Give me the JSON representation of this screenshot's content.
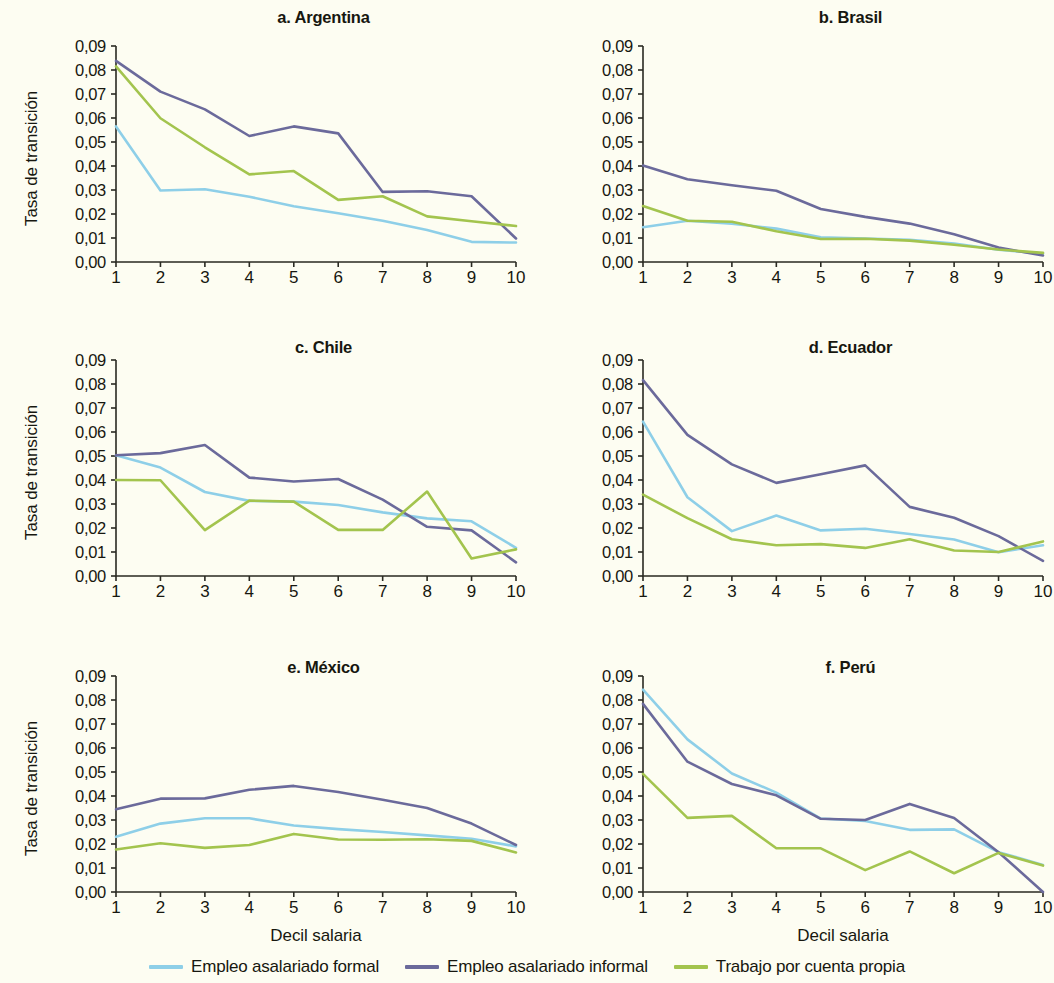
{
  "figure": {
    "background_color": "#fdfdf2",
    "axis_label_y": "Tasa de transición",
    "axis_label_x": "Decil salaria"
  },
  "legend": {
    "position": "bottom-center",
    "items": [
      {
        "label": "Empleo asalariado formal",
        "color": "#8ecfe8"
      },
      {
        "label": "Empleo asalariado informal",
        "color": "#6b6a9b"
      },
      {
        "label": "Trabajo por cuenta propia",
        "color": "#a3c44e"
      }
    ]
  },
  "axes": {
    "y_ticks": [
      "0,00",
      "0,01",
      "0,02",
      "0,03",
      "0,04",
      "0,05",
      "0,06",
      "0,07",
      "0,08",
      "0,09"
    ],
    "y_tick_values": [
      0,
      0.01,
      0.02,
      0.03,
      0.04,
      0.05,
      0.06,
      0.07,
      0.08,
      0.09
    ],
    "x_ticks": [
      "1",
      "2",
      "3",
      "4",
      "5",
      "6",
      "7",
      "8",
      "9",
      "10"
    ],
    "ylim": [
      0,
      0.09
    ],
    "xlim": [
      1,
      10
    ]
  },
  "chart_data": [
    {
      "type": "line",
      "title": "a. Argentina",
      "panel_id": "a",
      "xlabel": "Decil salaria",
      "ylabel": "Tasa de transición",
      "x": [
        1,
        2,
        3,
        4,
        5,
        6,
        7,
        8,
        9,
        10
      ],
      "categories": [
        "1",
        "2",
        "3",
        "4",
        "5",
        "6",
        "7",
        "8",
        "9",
        "10"
      ],
      "ylim": [
        0,
        0.09
      ],
      "grid": false,
      "legend_position": "figure-bottom",
      "series": [
        {
          "name": "Empleo asalariado formal",
          "color": "#8ecfe8",
          "values": [
            0.0565,
            0.0298,
            0.0303,
            0.0272,
            0.0232,
            0.0203,
            0.0172,
            0.0133,
            0.0084,
            0.0081
          ]
        },
        {
          "name": "Empleo asalariado informal",
          "color": "#6b6a9b",
          "values": [
            0.0838,
            0.071,
            0.0636,
            0.0525,
            0.0565,
            0.0536,
            0.0292,
            0.0295,
            0.0274,
            0.0098
          ]
        },
        {
          "name": "Trabajo por cuenta propia",
          "color": "#a3c44e",
          "values": [
            0.0815,
            0.0599,
            0.0478,
            0.0365,
            0.0379,
            0.0259,
            0.0274,
            0.019,
            0.017,
            0.015
          ]
        }
      ]
    },
    {
      "type": "line",
      "title": "b. Brasil",
      "panel_id": "b",
      "xlabel": "Decil salaria",
      "ylabel": "Tasa de transición",
      "x": [
        1,
        2,
        3,
        4,
        5,
        6,
        7,
        8,
        9,
        10
      ],
      "categories": [
        "1",
        "2",
        "3",
        "4",
        "5",
        "6",
        "7",
        "8",
        "9",
        "10"
      ],
      "ylim": [
        0,
        0.09
      ],
      "grid": false,
      "legend_position": "figure-bottom",
      "series": [
        {
          "name": "Empleo asalariado formal",
          "color": "#8ecfe8",
          "values": [
            0.0145,
            0.0172,
            0.016,
            0.0139,
            0.0103,
            0.0098,
            0.0093,
            0.0077,
            0.0051,
            0.0035
          ]
        },
        {
          "name": "Empleo asalariado informal",
          "color": "#6b6a9b",
          "values": [
            0.0402,
            0.0345,
            0.032,
            0.0297,
            0.0221,
            0.0188,
            0.016,
            0.0116,
            0.006,
            0.0027
          ]
        },
        {
          "name": "Trabajo por cuenta propia",
          "color": "#a3c44e",
          "values": [
            0.0233,
            0.0172,
            0.0168,
            0.0128,
            0.0096,
            0.0097,
            0.0089,
            0.0072,
            0.0052,
            0.0038
          ]
        }
      ]
    },
    {
      "type": "line",
      "title": "c. Chile",
      "panel_id": "c",
      "xlabel": "Decil salaria",
      "ylabel": "Tasa de transición",
      "x": [
        1,
        2,
        3,
        4,
        5,
        6,
        7,
        8,
        9,
        10
      ],
      "categories": [
        "1",
        "2",
        "3",
        "4",
        "5",
        "6",
        "7",
        "8",
        "9",
        "10"
      ],
      "ylim": [
        0,
        0.09
      ],
      "grid": false,
      "legend_position": "figure-bottom",
      "series": [
        {
          "name": "Empleo asalariado formal",
          "color": "#8ecfe8",
          "values": [
            0.0503,
            0.0452,
            0.035,
            0.0313,
            0.031,
            0.0296,
            0.0265,
            0.024,
            0.0228,
            0.0117
          ]
        },
        {
          "name": "Empleo asalariado informal",
          "color": "#6b6a9b",
          "values": [
            0.0503,
            0.0512,
            0.0546,
            0.041,
            0.0394,
            0.0404,
            0.0318,
            0.0205,
            0.019,
            0.0057
          ]
        },
        {
          "name": "Trabajo por cuenta propia",
          "color": "#a3c44e",
          "values": [
            0.04,
            0.0399,
            0.0191,
            0.0314,
            0.031,
            0.0192,
            0.0192,
            0.0352,
            0.0073,
            0.0111
          ]
        }
      ]
    },
    {
      "type": "line",
      "title": "d. Ecuador",
      "panel_id": "d",
      "xlabel": "Decil salaria",
      "ylabel": "Tasa de transición",
      "x": [
        1,
        2,
        3,
        4,
        5,
        6,
        7,
        8,
        9,
        10
      ],
      "categories": [
        "1",
        "2",
        "3",
        "4",
        "5",
        "6",
        "7",
        "8",
        "9",
        "10"
      ],
      "ylim": [
        0,
        0.09
      ],
      "grid": false,
      "legend_position": "figure-bottom",
      "series": [
        {
          "name": "Empleo asalariado formal",
          "color": "#8ecfe8",
          "values": [
            0.0643,
            0.0328,
            0.0187,
            0.0252,
            0.019,
            0.0197,
            0.0175,
            0.0152,
            0.0099,
            0.0128
          ]
        },
        {
          "name": "Empleo asalariado informal",
          "color": "#6b6a9b",
          "values": [
            0.0816,
            0.0588,
            0.0465,
            0.0388,
            0.0424,
            0.0461,
            0.0288,
            0.0243,
            0.0166,
            0.0063
          ]
        },
        {
          "name": "Trabajo por cuenta propia",
          "color": "#a3c44e",
          "values": [
            0.0339,
            0.0241,
            0.0153,
            0.0128,
            0.0133,
            0.0117,
            0.0153,
            0.0106,
            0.01,
            0.0144
          ]
        }
      ]
    },
    {
      "type": "line",
      "title": "e. México",
      "panel_id": "e",
      "xlabel": "Decil salaria",
      "ylabel": "Tasa de transición",
      "x": [
        1,
        2,
        3,
        4,
        5,
        6,
        7,
        8,
        9,
        10
      ],
      "categories": [
        "1",
        "2",
        "3",
        "4",
        "5",
        "6",
        "7",
        "8",
        "9",
        "10"
      ],
      "ylim": [
        0,
        0.09
      ],
      "grid": false,
      "legend_position": "figure-bottom",
      "series": [
        {
          "name": "Empleo asalariado formal",
          "color": "#8ecfe8",
          "values": [
            0.023,
            0.0285,
            0.0307,
            0.0307,
            0.0277,
            0.0262,
            0.025,
            0.0236,
            0.0222,
            0.019
          ]
        },
        {
          "name": "Empleo asalariado informal",
          "color": "#6b6a9b",
          "values": [
            0.0345,
            0.0389,
            0.039,
            0.0426,
            0.0442,
            0.0417,
            0.0384,
            0.035,
            0.0285,
            0.0196
          ]
        },
        {
          "name": "Trabajo por cuenta propia",
          "color": "#a3c44e",
          "values": [
            0.0177,
            0.0203,
            0.0184,
            0.0196,
            0.0242,
            0.0219,
            0.0218,
            0.022,
            0.0213,
            0.0165
          ]
        }
      ]
    },
    {
      "type": "line",
      "title": "f. Perú",
      "panel_id": "f",
      "xlabel": "Decil salaria",
      "ylabel": "Tasa de transición",
      "x": [
        1,
        2,
        3,
        4,
        5,
        6,
        7,
        8,
        9,
        10
      ],
      "categories": [
        "1",
        "2",
        "3",
        "4",
        "5",
        "6",
        "7",
        "8",
        "9",
        "10"
      ],
      "ylim": [
        0,
        0.09
      ],
      "grid": false,
      "legend_position": "figure-bottom",
      "series": [
        {
          "name": "Empleo asalariado formal",
          "color": "#8ecfe8",
          "values": [
            0.0843,
            0.0636,
            0.0494,
            0.0414,
            0.0306,
            0.0296,
            0.0259,
            0.0261,
            0.0166,
            0.0113
          ]
        },
        {
          "name": "Empleo asalariado informal",
          "color": "#6b6a9b",
          "values": [
            0.0784,
            0.0543,
            0.045,
            0.0403,
            0.0305,
            0.03,
            0.0367,
            0.0308,
            0.0166,
            0.0
          ]
        },
        {
          "name": "Trabajo por cuenta propia",
          "color": "#a3c44e",
          "values": [
            0.0492,
            0.0309,
            0.0317,
            0.0182,
            0.0182,
            0.0091,
            0.0169,
            0.0078,
            0.0163,
            0.011
          ]
        }
      ]
    }
  ]
}
